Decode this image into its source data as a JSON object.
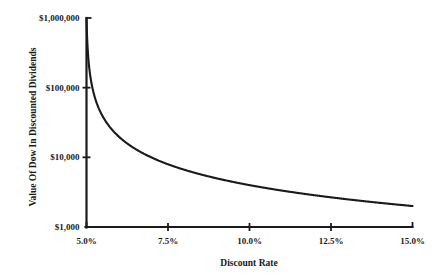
{
  "chart_data": {
    "type": "line",
    "title": "",
    "subtitle": "",
    "xlabel": "Discount Rate",
    "ylabel": "Value Of Dow In Discounted Dividends",
    "yscale": "log",
    "xscale": "linear",
    "xlim": [
      5.0,
      15.0
    ],
    "ylim": [
      1000,
      1000000
    ],
    "grid": false,
    "legend": false,
    "legend_position": "none",
    "x_tick_labels": [
      "5.0%",
      "7.5%",
      "10.0%",
      "12.5%",
      "15.0%"
    ],
    "x_tick_values": [
      5.0,
      7.5,
      10.0,
      12.5,
      15.0
    ],
    "y_tick_labels": [
      "$1,000,000",
      "$100,000",
      "$10,000",
      "$1,000"
    ],
    "y_tick_values": [
      1000000,
      100000,
      10000,
      1000
    ],
    "series": [
      {
        "name": "Value Of Dow In Discounted Dividends",
        "color": "#1a1a1a",
        "x": [
          5.0,
          5.05,
          5.1,
          5.15,
          5.2,
          5.3,
          5.4,
          5.5,
          5.6,
          5.75,
          5.9,
          6.0,
          6.25,
          6.5,
          6.75,
          7.0,
          7.25,
          7.5,
          7.75,
          8.0,
          8.5,
          9.0,
          9.5,
          10.0,
          10.5,
          11.0,
          11.5,
          12.0,
          12.5,
          13.0,
          13.5,
          14.0,
          14.5,
          15.0
        ],
        "y": [
          1000000,
          400000,
          200000,
          133000,
          100000,
          66700,
          50000,
          40000,
          33300,
          26700,
          22200,
          20000,
          16000,
          13300,
          11400,
          10000,
          8890,
          8000,
          7270,
          6670,
          5710,
          5000,
          4440,
          4000,
          3640,
          3330,
          3080,
          2860,
          2670,
          2500,
          2350,
          2220,
          2110,
          2000
        ]
      }
    ],
    "annotations": []
  },
  "axes": {
    "y_title": "Value Of Dow In Discounted Dividends",
    "x_title": "Discount Rate",
    "y_ticks": [
      {
        "label": "$1,000,000",
        "value": 1000000
      },
      {
        "label": "$100,000",
        "value": 100000
      },
      {
        "label": "$10,000",
        "value": 10000
      },
      {
        "label": "$1,000",
        "value": 1000
      }
    ],
    "x_ticks": [
      {
        "label": "5.0%",
        "value": 5.0
      },
      {
        "label": "7.5%",
        "value": 7.5
      },
      {
        "label": "10.0%",
        "value": 10.0
      },
      {
        "label": "12.5%",
        "value": 12.5
      },
      {
        "label": "15.0%",
        "value": 15.0
      }
    ]
  },
  "style": {
    "axis_color": "#1a1a1a",
    "curve_color": "#1a1a1a",
    "background": "#ffffff"
  }
}
